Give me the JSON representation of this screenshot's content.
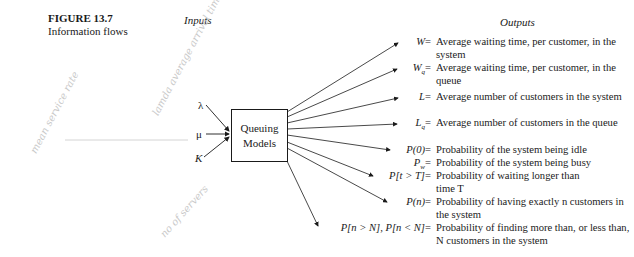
{
  "figure": {
    "number": "FIGURE 13.7",
    "caption": "Information flows"
  },
  "headers": {
    "inputs": "Inputs",
    "outputs": "Outputs"
  },
  "center_box": {
    "line1": "Queuing",
    "line2": "Models"
  },
  "inputs": [
    {
      "symbol": "λ"
    },
    {
      "symbol": "μ"
    },
    {
      "symbol": "K"
    }
  ],
  "outputs": [
    {
      "symbol": "W",
      "eq": "=",
      "description": "Average waiting time, per customer, in the system"
    },
    {
      "symbol": "Wq",
      "eq": "=",
      "description": "Average waiting time, per customer, in the queue"
    },
    {
      "symbol": "L",
      "eq": "=",
      "description": "Average number of customers in the system"
    },
    {
      "symbol": "Lq",
      "eq": "=",
      "description": "Average number of customers in the queue"
    },
    {
      "symbol": "P(0)",
      "eq": "=",
      "description": "Probability of the system being idle"
    },
    {
      "symbol": "Pw",
      "eq": "=",
      "description": "Probability of the system being busy"
    },
    {
      "symbol": "P[t > T]",
      "eq": "=",
      "description": "Probability of waiting longer than time T"
    },
    {
      "symbol": "P(n)",
      "eq": "=",
      "description": "Probability of having exactly n customers in the system"
    },
    {
      "symbol": "P[n > N], P[n < N]",
      "eq": "=",
      "description": "Probability of finding more than, or less than, N customers in the system"
    }
  ],
  "handwritten_notes": [
    {
      "text": "mean service rate"
    },
    {
      "text": "lamda average arrival time"
    },
    {
      "text": "no of servers"
    }
  ],
  "colors": {
    "ink": "#1a1a1a",
    "pencil": "#c9c9c9",
    "background": "#ffffff"
  }
}
